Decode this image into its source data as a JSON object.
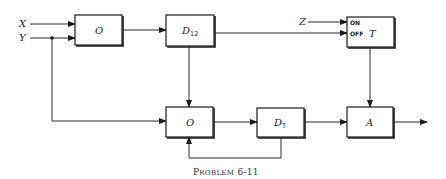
{
  "inputs": {
    "x": "X",
    "y": "Y",
    "z": "Z"
  },
  "blocks": {
    "or_top": {
      "label": "O"
    },
    "delay12": {
      "label": "D",
      "subscript": "12"
    },
    "timer": {
      "label": "T",
      "port_on": "ON",
      "port_off": "OFF"
    },
    "or_bottom": {
      "label": "O"
    },
    "delayT": {
      "label": "D",
      "subscript": "T"
    },
    "and": {
      "label": "A"
    }
  },
  "caption": {
    "prefix": "P",
    "rest": "ROBLEM",
    "number": "6-11"
  }
}
